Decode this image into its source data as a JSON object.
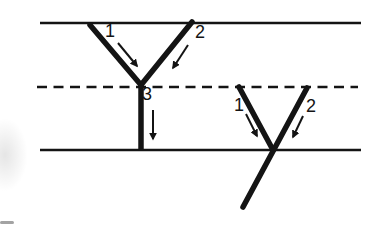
{
  "colors": {
    "ink": "#141414",
    "background": "#ffffff"
  },
  "diagram": {
    "left_junction": {
      "branch1_label": "1",
      "branch2_label": "2",
      "stem_label": "3"
    },
    "right_junction": {
      "branch1_label": "1",
      "branch2_label": "2"
    }
  }
}
